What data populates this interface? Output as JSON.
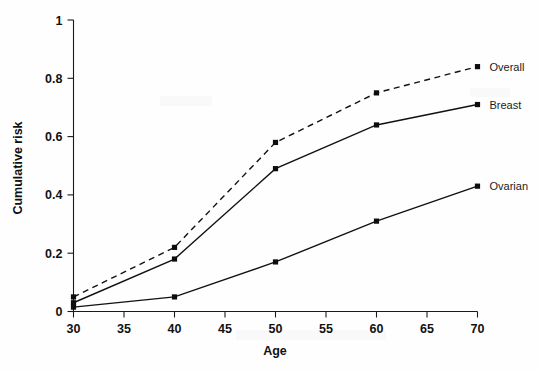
{
  "chart_data": {
    "type": "line",
    "title": "",
    "xlabel": "Age",
    "ylabel": "Cumulative risk",
    "xlim": [
      30,
      70
    ],
    "ylim": [
      0,
      1
    ],
    "grid": false,
    "legend_position": "right-of-plot-inline-labels",
    "x": [
      30,
      40,
      50,
      60,
      70
    ],
    "xticks": [
      30,
      35,
      40,
      45,
      50,
      55,
      60,
      65,
      70
    ],
    "xtick_labels": [
      "30",
      "35",
      "40",
      "45",
      "50",
      "55",
      "60",
      "65",
      "70"
    ],
    "yticks": [
      0,
      0.2,
      0.4,
      0.6,
      0.8,
      1
    ],
    "ytick_labels": [
      "0",
      "0.2",
      "0.4",
      "0.6",
      "0.8",
      "1"
    ],
    "series": [
      {
        "name": "Overall",
        "label": "Overall",
        "linestyle": "dashed",
        "marker": "square",
        "color": "#111111",
        "values": [
          0.05,
          0.22,
          0.58,
          0.75,
          0.84
        ]
      },
      {
        "name": "Breast",
        "label": "Breast",
        "linestyle": "solid",
        "marker": "square",
        "color": "#111111",
        "values": [
          0.03,
          0.18,
          0.49,
          0.64,
          0.71
        ]
      },
      {
        "name": "Ovarian",
        "label": "Ovarian",
        "linestyle": "solid",
        "marker": "square",
        "color": "#111111",
        "values": [
          0.015,
          0.05,
          0.17,
          0.31,
          0.43
        ]
      }
    ]
  },
  "labels": {
    "y_axis_title": "Cumulative risk",
    "x_axis_title": "Age"
  }
}
